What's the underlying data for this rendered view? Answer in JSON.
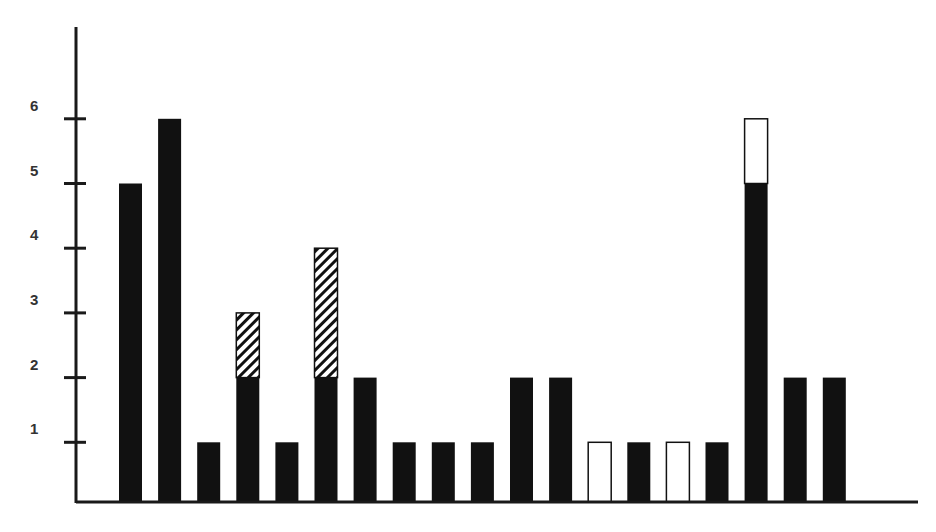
{
  "chart_data": {
    "type": "bar",
    "stacked": true,
    "title": "",
    "xlabel": "",
    "ylabel": "",
    "ylim": [
      0,
      7
    ],
    "yticks": [
      "1",
      "2",
      "3",
      "4",
      "5",
      "6"
    ],
    "grid": false,
    "legend": "none",
    "categories": [
      "1",
      "2",
      "3",
      "4",
      "5",
      "6",
      "7",
      "8",
      "9",
      "10",
      "11",
      "12",
      "13",
      "14",
      "15",
      "16",
      "17",
      "18",
      "19"
    ],
    "series": [
      {
        "name": "solid",
        "fill": "#111111",
        "values": [
          5,
          6,
          1,
          2,
          1,
          2,
          2,
          1,
          1,
          1,
          2,
          2,
          0,
          1,
          0,
          1,
          5,
          2,
          2
        ]
      },
      {
        "name": "hatched",
        "fill": "hatch",
        "values": [
          0,
          0,
          0,
          1,
          0,
          2,
          0,
          0,
          0,
          0,
          0,
          0,
          0,
          0,
          0,
          0,
          0,
          0,
          0
        ]
      },
      {
        "name": "open",
        "fill": "#ffffff",
        "values": [
          0,
          0,
          0,
          0,
          0,
          0,
          0,
          0,
          0,
          0,
          0,
          0,
          1,
          0,
          1,
          0,
          1,
          0,
          0
        ]
      }
    ]
  }
}
